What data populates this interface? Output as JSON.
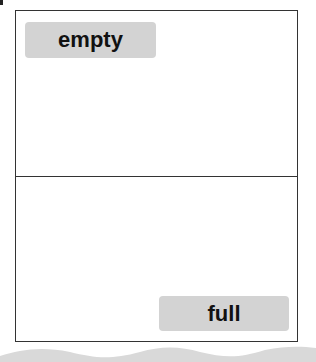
{
  "diagram": {
    "top_section": {
      "label": "empty"
    },
    "bottom_section": {
      "label": "full"
    }
  },
  "colors": {
    "frame_border": "#333333",
    "label_background": "#d3d3d3",
    "label_text": "#111111",
    "wave_fill": "#d9d9d9"
  }
}
